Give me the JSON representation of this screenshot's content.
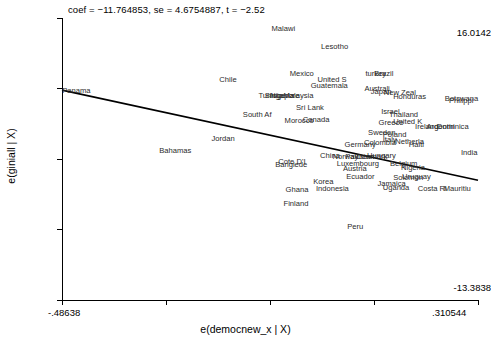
{
  "chart_data": {
    "type": "scatter",
    "title": "coef = −11.764853, se = 4.6754887, t = −2.52",
    "xlabel": "e(democnew_x | X)",
    "ylabel": "e(giniall | X)",
    "xlim": [
      -0.48638,
      0.310544
    ],
    "ylim": [
      -13.3838,
      16.0142
    ],
    "xticks": [
      "-.48638",
      ".310544"
    ],
    "yticks": [
      "16.0142",
      "-13.3838"
    ],
    "grid": false,
    "legend": null,
    "annotations": {
      "coef": "-11.764853",
      "se": "4.6754887",
      "t": "-2.52"
    },
    "fit_line": {
      "type": "linear",
      "slope": -11.764853,
      "x_start": -0.48638,
      "y_start": 8.5,
      "x_end": 0.310544,
      "y_end": -0.9
    },
    "point_labels": [
      {
        "label": "Malawi",
        "x": -0.085,
        "y": 14.9
      },
      {
        "label": "Lesotho",
        "x": 0.01,
        "y": 13.0
      },
      {
        "label": "Chile",
        "x": -0.185,
        "y": 9.6
      },
      {
        "label": "Mexico",
        "x": -0.05,
        "y": 10.2
      },
      {
        "label": "United S",
        "x": 0.003,
        "y": 9.6
      },
      {
        "label": "turkey",
        "x": 0.095,
        "y": 10.2
      },
      {
        "label": "Brazil",
        "x": 0.112,
        "y": 10.2
      },
      {
        "label": "Guatemala",
        "x": -0.01,
        "y": 8.9
      },
      {
        "label": "Australi",
        "x": 0.093,
        "y": 8.6
      },
      {
        "label": "Japan",
        "x": 0.105,
        "y": 8.3
      },
      {
        "label": "New Zeal",
        "x": 0.13,
        "y": 8.2
      },
      {
        "label": "Honduras",
        "x": 0.148,
        "y": 7.8
      },
      {
        "label": "Tunisia",
        "x": -0.11,
        "y": 7.9
      },
      {
        "label": "Singapore",
        "x": -0.098,
        "y": 7.9
      },
      {
        "label": "Nigeria",
        "x": -0.088,
        "y": 7.9
      },
      {
        "label": "Malaysia",
        "x": -0.062,
        "y": 7.9
      },
      {
        "label": "Panama",
        "x": -0.486,
        "y": 8.4
      },
      {
        "label": "Botswana",
        "x": 0.247,
        "y": 7.6
      },
      {
        "label": "Philippi",
        "x": 0.255,
        "y": 7.4
      },
      {
        "label": "Sri Lank",
        "x": -0.038,
        "y": 6.6
      },
      {
        "label": "South Af",
        "x": -0.14,
        "y": 5.9
      },
      {
        "label": "Morocco",
        "x": -0.06,
        "y": 5.3
      },
      {
        "label": "Canada",
        "x": -0.025,
        "y": 5.4
      },
      {
        "label": "Israel",
        "x": 0.125,
        "y": 6.2
      },
      {
        "label": "Thailand",
        "x": 0.14,
        "y": 5.9
      },
      {
        "label": "Greece",
        "x": 0.12,
        "y": 5.1
      },
      {
        "label": "United K",
        "x": 0.148,
        "y": 5.2
      },
      {
        "label": "Ireland",
        "x": 0.19,
        "y": 4.6
      },
      {
        "label": "Argentin",
        "x": 0.212,
        "y": 4.6
      },
      {
        "label": "Dominica",
        "x": 0.232,
        "y": 4.6
      },
      {
        "label": "Sweden",
        "x": 0.1,
        "y": 4.0
      },
      {
        "label": "Poland",
        "x": 0.128,
        "y": 3.8
      },
      {
        "label": "Italy",
        "x": 0.128,
        "y": 3.3
      },
      {
        "label": "Netherla",
        "x": 0.152,
        "y": 3.1
      },
      {
        "label": "Jordan",
        "x": -0.2,
        "y": 3.4
      },
      {
        "label": "Bahamas",
        "x": -0.3,
        "y": 2.2
      },
      {
        "label": "Colombia",
        "x": 0.092,
        "y": 3.0
      },
      {
        "label": "Germany",
        "x": 0.055,
        "y": 2.8
      },
      {
        "label": "Haiti",
        "x": 0.178,
        "y": 2.8
      },
      {
        "label": "China",
        "x": 0.008,
        "y": 1.6
      },
      {
        "label": "Norway",
        "x": 0.032,
        "y": 1.5
      },
      {
        "label": "Pakistan",
        "x": 0.056,
        "y": 1.5
      },
      {
        "label": "Denmark",
        "x": 0.078,
        "y": 1.5
      },
      {
        "label": "Hungary",
        "x": 0.098,
        "y": 1.6
      },
      {
        "label": "Cote D'I",
        "x": -0.072,
        "y": 1.0
      },
      {
        "label": "Banglede",
        "x": -0.078,
        "y": 0.7
      },
      {
        "label": "Luxembourg",
        "x": 0.04,
        "y": 0.8
      },
      {
        "label": "Austria",
        "x": 0.052,
        "y": 0.3
      },
      {
        "label": "Belgium",
        "x": 0.142,
        "y": 0.8
      },
      {
        "label": "Nigeria",
        "x": 0.163,
        "y": 0.4
      },
      {
        "label": "Ecuador",
        "x": 0.058,
        "y": -0.6
      },
      {
        "label": "Korea",
        "x": -0.005,
        "y": -1.1
      },
      {
        "label": "Uruguay",
        "x": 0.165,
        "y": -0.6
      },
      {
        "label": "Solomon",
        "x": 0.148,
        "y": -0.7
      },
      {
        "label": "Jamaica",
        "x": 0.118,
        "y": -1.3
      },
      {
        "label": "Uganda",
        "x": 0.128,
        "y": -1.7
      },
      {
        "label": "Ghana",
        "x": -0.058,
        "y": -1.9
      },
      {
        "label": "Indonesia",
        "x": 0.0,
        "y": -1.8
      },
      {
        "label": "Costa Ri",
        "x": 0.195,
        "y": -1.8
      },
      {
        "label": "Mauritiu",
        "x": 0.245,
        "y": -1.8
      },
      {
        "label": "Finland",
        "x": -0.062,
        "y": -3.4
      },
      {
        "label": "India",
        "x": 0.278,
        "y": 1.9
      },
      {
        "label": "Peru",
        "x": 0.06,
        "y": -5.8
      }
    ]
  }
}
